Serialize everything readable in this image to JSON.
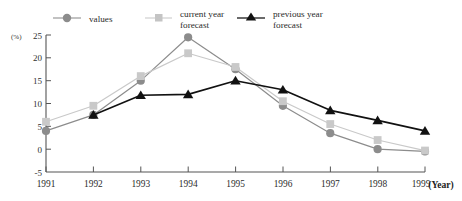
{
  "chart_data": {
    "type": "line",
    "title": "",
    "xlabel": "(Year)",
    "ylabel": "(%)",
    "grid": false,
    "legend_position": "top",
    "categories": [
      "1991",
      "1992",
      "1993",
      "1994",
      "1995",
      "1996",
      "1997",
      "1998",
      "1999"
    ],
    "x": [
      1991,
      1992,
      1993,
      1994,
      1995,
      1996,
      1997,
      1998,
      1999
    ],
    "xlim": [
      1991,
      1999
    ],
    "ylim": [
      -5,
      25
    ],
    "yticks": [
      -5,
      0,
      5,
      10,
      15,
      20,
      25
    ],
    "ytick_labels": [
      "-5",
      "0",
      "5",
      "10",
      "15",
      "20",
      "25"
    ],
    "series": [
      {
        "name": "values",
        "marker": "circle",
        "color": "#8c8c8c",
        "values": [
          4,
          7.5,
          15,
          24.5,
          17.5,
          9.5,
          3.5,
          0,
          -0.5
        ]
      },
      {
        "name": "current year forecast",
        "marker": "square",
        "color": "#c9c9c9",
        "values": [
          6,
          9.5,
          16,
          21,
          18,
          10.5,
          5.5,
          2,
          -0.3
        ]
      },
      {
        "name": "previous year forecast",
        "marker": "triangle",
        "color": "#111111",
        "values": [
          null,
          7.5,
          11.8,
          12,
          15,
          13,
          8.5,
          6.3,
          4
        ]
      }
    ]
  },
  "legend": {
    "items": [
      {
        "label": "values",
        "line1": "values",
        "line2": ""
      },
      {
        "label": "current year forecast",
        "line1": "current year",
        "line2": "forecast"
      },
      {
        "label": "previous year forecast",
        "line1": "previous year",
        "line2": "forecast"
      }
    ]
  },
  "axes": {
    "y_unit": "(%)",
    "x_unit": "(Year)"
  },
  "colors": {
    "values": "#8c8c8c",
    "current_year_forecast": "#c9c9c9",
    "previous_year_forecast": "#111111",
    "axis": "#555555",
    "background": "#ffffff"
  }
}
